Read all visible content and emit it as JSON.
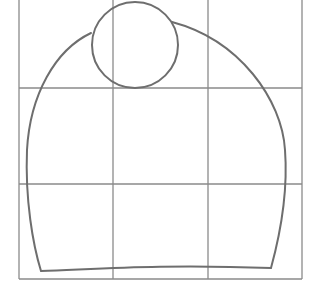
{
  "drawing": {
    "description": "Pencil sketch on a 3x3 grid: a dome/arch shape with a circle on top",
    "colors": {
      "background": "#ffffff",
      "grid": "#8a8a8a",
      "stroke": "#6e6e6e"
    },
    "grid": {
      "vertical_x": [
        19,
        113,
        208,
        302
      ],
      "horizontal_y": [
        0,
        88,
        184,
        279
      ]
    },
    "circle": {
      "cx": 135,
      "cy": 45,
      "r": 43
    }
  }
}
